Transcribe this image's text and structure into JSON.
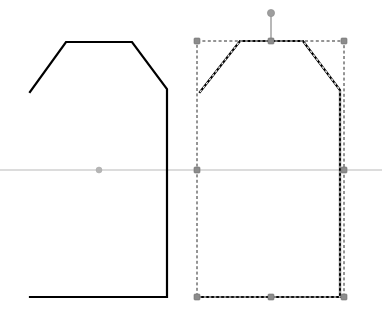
{
  "canvas": {
    "label": "Vector Shape Editor Canvas",
    "width": 382,
    "height": 320,
    "background_color": "#ffffff"
  },
  "colors": {
    "shape_stroke": "#000000",
    "axis_line": "#b9b9b9",
    "selection_dash": "#2b2b2b",
    "handle_fill": "#8c8c8c",
    "handle_stroke": "#6f6f6f",
    "rotation_handle_fill": "#9e9e9e",
    "center_dot": "#b5b5b5"
  },
  "guides": {
    "horizontal_axis": {
      "name": "horizontal-guide",
      "y": 170,
      "x_start": 0,
      "x_end": 382,
      "color": "#b9b9b9"
    }
  },
  "shapes": [
    {
      "id": "shape-left",
      "name": "pentagon-shape-unselected",
      "selected": false,
      "stroke_color": "#000000",
      "stroke_width": 2.2,
      "fill": "none",
      "vertices": [
        [
          30,
          92
        ],
        [
          66,
          42
        ],
        [
          132,
          42
        ],
        [
          167,
          89
        ],
        [
          167,
          297
        ],
        [
          30,
          297
        ]
      ],
      "center_point": {
        "x": 99,
        "y": 170
      }
    },
    {
      "id": "shape-right",
      "name": "pentagon-shape-selected",
      "selected": true,
      "stroke_color": "#000000",
      "stroke_width": 2.2,
      "fill": "none",
      "vertices": [
        [
          200,
          92
        ],
        [
          240,
          41
        ],
        [
          303,
          41
        ],
        [
          340,
          90
        ],
        [
          340,
          297
        ],
        [
          200,
          297
        ]
      ],
      "selection_box": {
        "name": "selection-bounding-box",
        "x": 197,
        "y": 41,
        "width": 147,
        "height": 256,
        "dash_color": "#2b2b2b"
      },
      "rotation_handle": {
        "name": "rotation-handle",
        "x": 271,
        "y": 13,
        "stem_from_y": 41,
        "radius": 3.6
      },
      "handles": [
        {
          "name": "handle-top-left",
          "x": 197,
          "y": 41,
          "cursor": "nwse-resize"
        },
        {
          "name": "handle-top-center",
          "x": 271,
          "y": 41,
          "cursor": "ns-resize"
        },
        {
          "name": "handle-top-right",
          "x": 344,
          "y": 41,
          "cursor": "nesw-resize"
        },
        {
          "name": "handle-middle-left",
          "x": 197,
          "y": 170,
          "cursor": "ew-resize"
        },
        {
          "name": "handle-middle-right",
          "x": 344,
          "y": 170,
          "cursor": "ew-resize"
        },
        {
          "name": "handle-bottom-left",
          "x": 197,
          "y": 297,
          "cursor": "nesw-resize"
        },
        {
          "name": "handle-bottom-center",
          "x": 271,
          "y": 297,
          "cursor": "ns-resize"
        },
        {
          "name": "handle-bottom-right",
          "x": 344,
          "y": 297,
          "cursor": "nwse-resize"
        }
      ]
    }
  ]
}
